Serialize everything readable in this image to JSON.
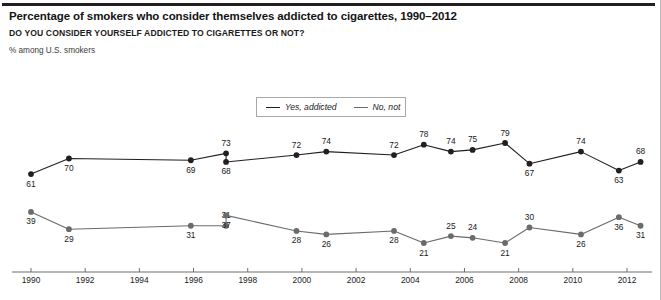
{
  "header": {
    "title": "Percentage of smokers who consider themselves addicted to cigarettes, 1990–2012",
    "question": "DO YOU CONSIDER YOURSELF ADDICTED TO CIGARETTES OR NOT?",
    "subnote": "% among U.S. smokers"
  },
  "legend": {
    "position": "top-center",
    "items": [
      {
        "label": "Yes, addicted",
        "color": "#231f20"
      },
      {
        "label": "No, not",
        "color": "#6b6b6b"
      }
    ]
  },
  "chart_data": {
    "type": "line",
    "title": "Percentage of smokers who consider themselves addicted to cigarettes, 1990–2012",
    "subtitle": "DO YOU CONSIDER YOURSELF ADDICTED TO CIGARETTES OR NOT?",
    "ylabel": "% among U.S. smokers",
    "xlabel": "",
    "grid": false,
    "legend_position": "top-center",
    "xlim": [
      1989.3,
      2013.0
    ],
    "ylim": [
      0,
      100
    ],
    "xticks": [
      1990,
      1992,
      1994,
      1996,
      1998,
      2000,
      2002,
      2004,
      2006,
      2008,
      2010,
      2012
    ],
    "xtick_labels": [
      "1990",
      "1992",
      "1994",
      "1996",
      "1998",
      "2000",
      "2002",
      "2004",
      "2006",
      "2008",
      "2010",
      "2012"
    ],
    "x": [
      1990.0,
      1991.4,
      1995.9,
      1997.2,
      1997.2,
      1999.8,
      2000.9,
      2003.4,
      2004.5,
      2005.5,
      2006.3,
      2007.5,
      2008.4,
      2010.3,
      2011.7,
      2012.5
    ],
    "series": [
      {
        "name": "Yes, addicted",
        "color": "#231f20",
        "values": [
          61,
          70,
          69,
          73,
          68,
          72,
          74,
          72,
          78,
          74,
          75,
          79,
          67,
          74,
          63,
          68
        ],
        "label_positions": [
          "below",
          "below",
          "below",
          "above",
          "below",
          "above",
          "above",
          "above",
          "above",
          "above",
          "above",
          "above",
          "below",
          "above",
          "below",
          "above"
        ]
      },
      {
        "name": "No, not",
        "color": "#6b6b6b",
        "values": [
          39,
          29,
          31,
          31,
          37,
          28,
          26,
          28,
          21,
          25,
          24,
          21,
          30,
          26,
          36,
          31
        ],
        "label_positions": [
          "below",
          "below",
          "below",
          "above",
          "below",
          "below",
          "below",
          "below",
          "below",
          "above",
          "above",
          "below",
          "above",
          "below",
          "below",
          "below"
        ]
      }
    ]
  }
}
